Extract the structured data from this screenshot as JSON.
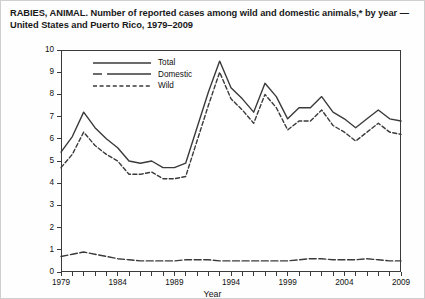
{
  "title": "RABIES, ANIMAL. Number of reported cases among wild and domestic animals,* by year — United States and Puerto Rico, 1979–2009",
  "axes": {
    "ylabel": "Number†",
    "xlabel": "Year",
    "yticks": [
      "0",
      "1",
      "2",
      "3",
      "4",
      "5",
      "6",
      "7",
      "8",
      "9",
      "10"
    ],
    "xticks": [
      "1979",
      "1984",
      "1989",
      "1994",
      "1999",
      "2004",
      "2009"
    ]
  },
  "legend": {
    "items": [
      {
        "label": "Total",
        "style": "solid"
      },
      {
        "label": "Domestic",
        "style": "dash-dot"
      },
      {
        "label": "Wild",
        "style": "dashed"
      }
    ]
  },
  "colors": {
    "line": "#3a3a3a",
    "frame": "#3a3a3a",
    "background": "#ffffff",
    "page_border": "#cfcfcf"
  },
  "chart_data": {
    "type": "line",
    "title": "RABIES, ANIMAL. Number of reported cases among wild and domestic animals,* by year — United States and Puerto Rico, 1979–2009",
    "xlabel": "Year",
    "ylabel": "Number†",
    "xlim": [
      1979,
      2009
    ],
    "ylim": [
      0,
      10
    ],
    "grid": false,
    "legend_position": "top-left-inside",
    "x": [
      1979,
      1980,
      1981,
      1982,
      1983,
      1984,
      1985,
      1986,
      1987,
      1988,
      1989,
      1990,
      1991,
      1992,
      1993,
      1994,
      1995,
      1996,
      1997,
      1998,
      1999,
      2000,
      2001,
      2002,
      2003,
      2004,
      2005,
      2006,
      2007,
      2008,
      2009
    ],
    "series": [
      {
        "name": "Total",
        "style": "solid",
        "values": [
          5.4,
          6.1,
          7.2,
          6.5,
          6.0,
          5.6,
          5.0,
          4.9,
          5.0,
          4.7,
          4.7,
          4.9,
          6.5,
          8.1,
          9.5,
          8.3,
          7.8,
          7.2,
          8.5,
          7.9,
          6.9,
          7.4,
          7.4,
          7.9,
          7.2,
          6.9,
          6.5,
          6.9,
          7.3,
          6.9,
          6.8
        ]
      },
      {
        "name": "Domestic",
        "style": "dash-dot",
        "values": [
          0.7,
          0.8,
          0.9,
          0.8,
          0.7,
          0.6,
          0.55,
          0.5,
          0.5,
          0.5,
          0.5,
          0.55,
          0.55,
          0.55,
          0.5,
          0.5,
          0.5,
          0.5,
          0.5,
          0.5,
          0.5,
          0.55,
          0.6,
          0.6,
          0.55,
          0.55,
          0.55,
          0.6,
          0.55,
          0.5,
          0.5
        ]
      },
      {
        "name": "Wild",
        "style": "dashed",
        "values": [
          4.7,
          5.3,
          6.3,
          5.7,
          5.3,
          5.0,
          4.4,
          4.4,
          4.5,
          4.2,
          4.2,
          4.3,
          5.9,
          7.5,
          9.0,
          7.8,
          7.3,
          6.7,
          8.0,
          7.4,
          6.4,
          6.8,
          6.8,
          7.3,
          6.6,
          6.3,
          5.9,
          6.3,
          6.7,
          6.3,
          6.2
        ]
      }
    ]
  }
}
